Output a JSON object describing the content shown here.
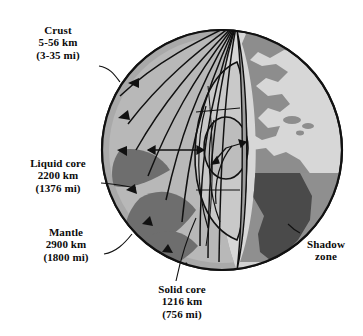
{
  "figure": {
    "type": "cutaway-diagram"
  },
  "labels": {
    "crust": {
      "name": "Crust",
      "depth_km": "5-56 km",
      "depth_mi": "(3-35 mi)"
    },
    "liquid": {
      "name": "Liquid core",
      "depth_km": "2200 km",
      "depth_mi": "(1376 mi)"
    },
    "mantle": {
      "name": "Mantle",
      "depth_km": "2900 km",
      "depth_mi": "(1800 mi)"
    },
    "solid": {
      "name": "Solid core",
      "depth_km": "1216 km",
      "depth_mi": "(756 mi)"
    },
    "shadow": {
      "line1": "Shadow",
      "line2": "zone"
    }
  },
  "colors": {
    "outline": "#111111",
    "crust": "#a9a9a9",
    "mantle_light": "#b8b8b8",
    "mantle_dark": "#6e6e6e",
    "outer_core": "#c9c9c9",
    "inner_core": "#bdbdbd",
    "ocean": "#d7d7d7",
    "land": "#8d8d8d",
    "shadow_band": "#8f8f8f",
    "shadow_land": "#4a4a4a",
    "background": "#ffffff"
  },
  "geometry": {
    "globe_center_x": 222,
    "globe_center_y": 150,
    "globe_radius": 120,
    "focus_x": 237,
    "focus_y": 22,
    "shadow_band_top_y": 173,
    "shadow_band_bottom_y": 262
  }
}
